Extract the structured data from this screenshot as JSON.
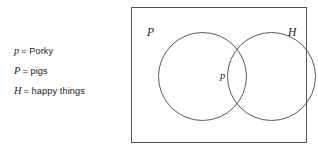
{
  "figure": {
    "type": "venn-diagram",
    "caption_partial": ""
  },
  "legend": {
    "rows": [
      {
        "symbol": "p",
        "equals": "=",
        "text": "Porky"
      },
      {
        "symbol": "P",
        "equals": "=",
        "text": "pigs"
      },
      {
        "symbol": "H",
        "equals": "=",
        "text": "happy things"
      }
    ]
  },
  "diagram": {
    "universe_label": "",
    "sets": [
      {
        "id": "set-p",
        "label": "P",
        "position": "left"
      },
      {
        "id": "set-h",
        "label": "H",
        "position": "right"
      }
    ],
    "elements": [
      {
        "id": "element-p",
        "label": "p",
        "region": "intersection"
      }
    ]
  },
  "colors": {
    "stroke": "#545454",
    "circle_stroke": "#5a5a5a",
    "text": "#1b1b1b",
    "background": "#ffffff"
  }
}
